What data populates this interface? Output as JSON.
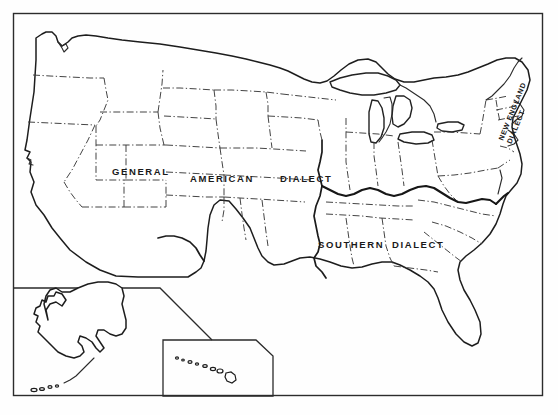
{
  "figure": {
    "kind": "dialect-map",
    "region": "United States",
    "background_color": "#fefefe",
    "line_color": "#1d1d1d",
    "frame": {
      "name": "map-border-frame",
      "x": 13,
      "y": 13,
      "width": 530,
      "height": 383
    }
  },
  "labels": {
    "general_american": {
      "text_parts": [
        "GENERAL",
        "AMERICAN",
        "DIALECT"
      ],
      "full_text": "GENERAL AMERICAN DIALECT"
    },
    "southern": {
      "text_parts": [
        "SOUTHERN",
        "DIALECT"
      ],
      "full_text": "SOUTHERN DIALECT"
    },
    "new_england": {
      "line1": "NEW ENGLAND",
      "line2": "DIALECT",
      "full_text": "NEW ENGLAND DIALECT",
      "rotation_deg": -68
    }
  },
  "insets": [
    {
      "name": "alaska-inset",
      "label": "Alaska"
    },
    {
      "name": "hawaii-inset",
      "label": "Hawaii"
    }
  ],
  "legend_notes": {
    "state_boundary_style": "dash-dot thin line",
    "dialect_boundary_style": "heavy solid line",
    "coastline_style": "solid outline"
  }
}
